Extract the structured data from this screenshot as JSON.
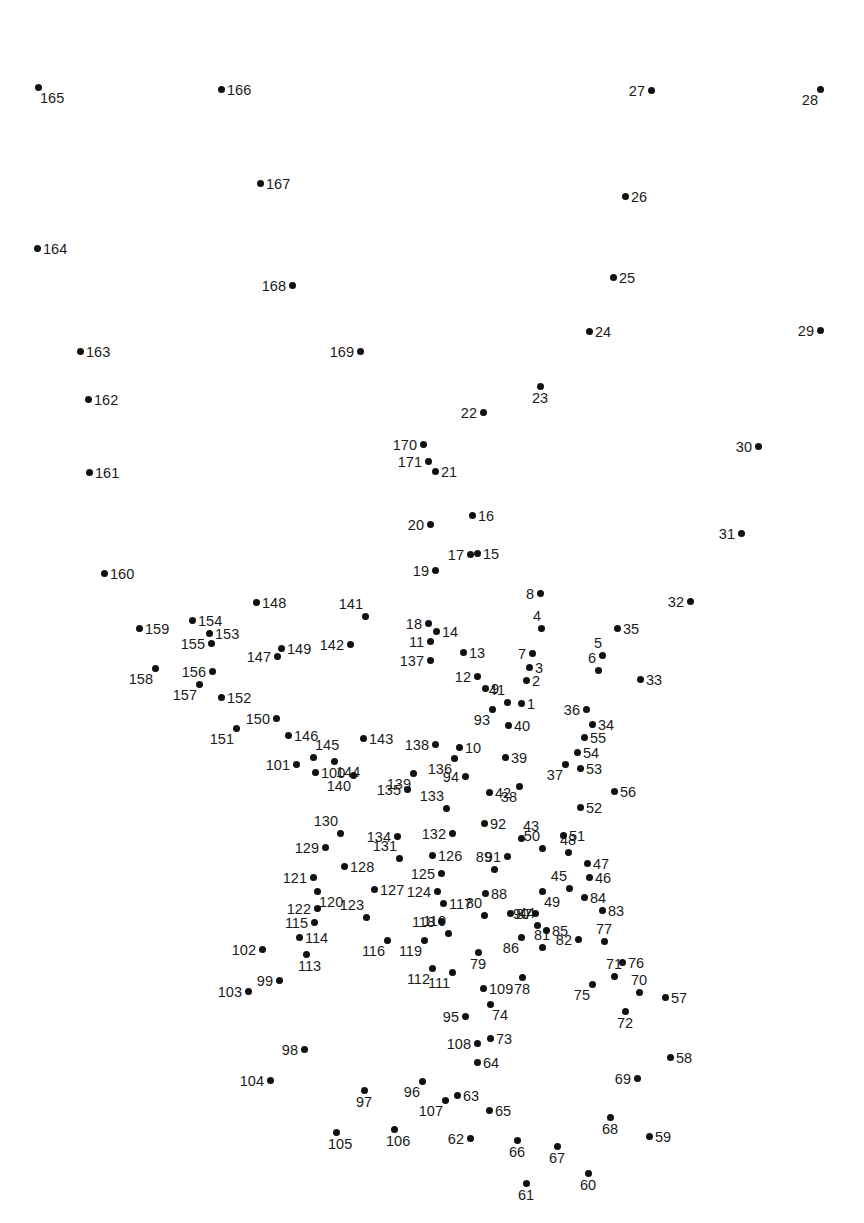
{
  "page": {
    "width": 864,
    "height": 1223,
    "background_color": "#ffffff",
    "dot_color": "#101010",
    "label_color": "#1a1a1a",
    "total_dots": 171
  },
  "chart_data": {
    "type": "scatter",
    "title": "",
    "xlabel": "",
    "ylabel": "",
    "grid": false,
    "legend": null,
    "xlim": [
      0,
      864
    ],
    "ylim": [
      0,
      1223
    ],
    "note": "Numbered connect-the-dots points; coordinates are pixel positions with y increasing downward.",
    "points": [
      {
        "n": 1,
        "x": 521,
        "y": 703,
        "pos": "right"
      },
      {
        "n": 2,
        "x": 526,
        "y": 680,
        "pos": "right"
      },
      {
        "n": 3,
        "x": 529,
        "y": 667,
        "pos": "right"
      },
      {
        "n": 4,
        "x": 541,
        "y": 628,
        "pos": "above"
      },
      {
        "n": 5,
        "x": 602,
        "y": 655,
        "pos": "above"
      },
      {
        "n": 6,
        "x": 598,
        "y": 670,
        "pos": "above-left"
      },
      {
        "n": 7,
        "x": 532,
        "y": 653,
        "pos": "left"
      },
      {
        "n": 8,
        "x": 540,
        "y": 593,
        "pos": "left"
      },
      {
        "n": 9,
        "x": 485,
        "y": 688,
        "pos": "right"
      },
      {
        "n": 10,
        "x": 459,
        "y": 747,
        "pos": "right"
      },
      {
        "n": 11,
        "x": 430,
        "y": 641,
        "pos": "left"
      },
      {
        "n": 12,
        "x": 477,
        "y": 676,
        "pos": "left"
      },
      {
        "n": 13,
        "x": 463,
        "y": 652,
        "pos": "right"
      },
      {
        "n": 14,
        "x": 436,
        "y": 631,
        "pos": "right"
      },
      {
        "n": 15,
        "x": 477,
        "y": 553,
        "pos": "right"
      },
      {
        "n": 16,
        "x": 472,
        "y": 515,
        "pos": "right"
      },
      {
        "n": 17,
        "x": 470,
        "y": 554,
        "pos": "left"
      },
      {
        "n": 18,
        "x": 428,
        "y": 623,
        "pos": "left"
      },
      {
        "n": 19,
        "x": 435,
        "y": 570,
        "pos": "left"
      },
      {
        "n": 20,
        "x": 430,
        "y": 524,
        "pos": "left"
      },
      {
        "n": 21,
        "x": 435,
        "y": 471,
        "pos": "right"
      },
      {
        "n": 22,
        "x": 483,
        "y": 412,
        "pos": "left"
      },
      {
        "n": 23,
        "x": 540,
        "y": 386,
        "pos": "below"
      },
      {
        "n": 24,
        "x": 589,
        "y": 331,
        "pos": "right"
      },
      {
        "n": 25,
        "x": 613,
        "y": 277,
        "pos": "right"
      },
      {
        "n": 26,
        "x": 625,
        "y": 196,
        "pos": "right"
      },
      {
        "n": 27,
        "x": 651,
        "y": 90,
        "pos": "left"
      },
      {
        "n": 28,
        "x": 820,
        "y": 89,
        "pos": "below-left"
      },
      {
        "n": 29,
        "x": 820,
        "y": 330,
        "pos": "left"
      },
      {
        "n": 30,
        "x": 758,
        "y": 446,
        "pos": "left"
      },
      {
        "n": 31,
        "x": 741,
        "y": 533,
        "pos": "left"
      },
      {
        "n": 32,
        "x": 690,
        "y": 601,
        "pos": "left"
      },
      {
        "n": 33,
        "x": 640,
        "y": 679,
        "pos": "right"
      },
      {
        "n": 34,
        "x": 592,
        "y": 724,
        "pos": "right"
      },
      {
        "n": 35,
        "x": 617,
        "y": 628,
        "pos": "right"
      },
      {
        "n": 36,
        "x": 586,
        "y": 709,
        "pos": "left"
      },
      {
        "n": 37,
        "x": 565,
        "y": 764,
        "pos": "below-left"
      },
      {
        "n": 38,
        "x": 519,
        "y": 786,
        "pos": "below-left"
      },
      {
        "n": 39,
        "x": 505,
        "y": 757,
        "pos": "right"
      },
      {
        "n": 40,
        "x": 508,
        "y": 725,
        "pos": "right"
      },
      {
        "n": 41,
        "x": 507,
        "y": 702,
        "pos": "above-left"
      },
      {
        "n": 42,
        "x": 489,
        "y": 792,
        "pos": "right"
      },
      {
        "n": 43,
        "x": 521,
        "y": 838,
        "pos": "above-right"
      },
      {
        "n": 44,
        "x": 537,
        "y": 925,
        "pos": "above-left"
      },
      {
        "n": 45,
        "x": 569,
        "y": 888,
        "pos": "above-left"
      },
      {
        "n": 46,
        "x": 589,
        "y": 877,
        "pos": "right"
      },
      {
        "n": 47,
        "x": 587,
        "y": 863,
        "pos": "right"
      },
      {
        "n": 48,
        "x": 568,
        "y": 852,
        "pos": "above"
      },
      {
        "n": 49,
        "x": 542,
        "y": 891,
        "pos": "below-right"
      },
      {
        "n": 50,
        "x": 542,
        "y": 848,
        "pos": "above-left"
      },
      {
        "n": 51,
        "x": 563,
        "y": 835,
        "pos": "right"
      },
      {
        "n": 52,
        "x": 580,
        "y": 807,
        "pos": "right"
      },
      {
        "n": 53,
        "x": 580,
        "y": 768,
        "pos": "right"
      },
      {
        "n": 54,
        "x": 577,
        "y": 752,
        "pos": "right"
      },
      {
        "n": 55,
        "x": 584,
        "y": 737,
        "pos": "right"
      },
      {
        "n": 56,
        "x": 614,
        "y": 791,
        "pos": "right"
      },
      {
        "n": 57,
        "x": 665,
        "y": 997,
        "pos": "right"
      },
      {
        "n": 58,
        "x": 670,
        "y": 1057,
        "pos": "right"
      },
      {
        "n": 59,
        "x": 649,
        "y": 1136,
        "pos": "right"
      },
      {
        "n": 60,
        "x": 588,
        "y": 1173,
        "pos": "below"
      },
      {
        "n": 61,
        "x": 526,
        "y": 1183,
        "pos": "below"
      },
      {
        "n": 62,
        "x": 470,
        "y": 1138,
        "pos": "left"
      },
      {
        "n": 63,
        "x": 457,
        "y": 1095,
        "pos": "right"
      },
      {
        "n": 64,
        "x": 477,
        "y": 1062,
        "pos": "right"
      },
      {
        "n": 65,
        "x": 489,
        "y": 1110,
        "pos": "right"
      },
      {
        "n": 66,
        "x": 517,
        "y": 1140,
        "pos": "below"
      },
      {
        "n": 67,
        "x": 557,
        "y": 1146,
        "pos": "below"
      },
      {
        "n": 68,
        "x": 610,
        "y": 1117,
        "pos": "below"
      },
      {
        "n": 69,
        "x": 637,
        "y": 1078,
        "pos": "left"
      },
      {
        "n": 70,
        "x": 639,
        "y": 992,
        "pos": "above"
      },
      {
        "n": 71,
        "x": 614,
        "y": 976,
        "pos": "above"
      },
      {
        "n": 72,
        "x": 625,
        "y": 1011,
        "pos": "below"
      },
      {
        "n": 73,
        "x": 490,
        "y": 1038,
        "pos": "right"
      },
      {
        "n": 74,
        "x": 490,
        "y": 1004,
        "pos": "below-right"
      },
      {
        "n": 75,
        "x": 592,
        "y": 984,
        "pos": "below-left"
      },
      {
        "n": 76,
        "x": 622,
        "y": 962,
        "pos": "right"
      },
      {
        "n": 77,
        "x": 604,
        "y": 941,
        "pos": "above"
      },
      {
        "n": 78,
        "x": 522,
        "y": 977,
        "pos": "below"
      },
      {
        "n": 79,
        "x": 478,
        "y": 952,
        "pos": "below"
      },
      {
        "n": 80,
        "x": 484,
        "y": 915,
        "pos": "above-left"
      },
      {
        "n": 81,
        "x": 542,
        "y": 947,
        "pos": "above"
      },
      {
        "n": 82,
        "x": 578,
        "y": 939,
        "pos": "left"
      },
      {
        "n": 83,
        "x": 602,
        "y": 910,
        "pos": "right"
      },
      {
        "n": 84,
        "x": 584,
        "y": 897,
        "pos": "right"
      },
      {
        "n": 85,
        "x": 546,
        "y": 930,
        "pos": "right"
      },
      {
        "n": 86,
        "x": 521,
        "y": 937,
        "pos": "below-left"
      },
      {
        "n": 87,
        "x": 510,
        "y": 913,
        "pos": "right"
      },
      {
        "n": 88,
        "x": 485,
        "y": 893,
        "pos": "right"
      },
      {
        "n": 89,
        "x": 494,
        "y": 869,
        "pos": "above-left"
      },
      {
        "n": 90,
        "x": 535,
        "y": 913,
        "pos": "left"
      },
      {
        "n": 91,
        "x": 507,
        "y": 856,
        "pos": "left"
      },
      {
        "n": 92,
        "x": 484,
        "y": 823,
        "pos": "right"
      },
      {
        "n": 93,
        "x": 492,
        "y": 709,
        "pos": "below-left"
      },
      {
        "n": 94,
        "x": 465,
        "y": 776,
        "pos": "left"
      },
      {
        "n": 95,
        "x": 465,
        "y": 1016,
        "pos": "left"
      },
      {
        "n": 96,
        "x": 422,
        "y": 1081,
        "pos": "below-left"
      },
      {
        "n": 97,
        "x": 364,
        "y": 1090,
        "pos": "below"
      },
      {
        "n": 98,
        "x": 304,
        "y": 1049,
        "pos": "left"
      },
      {
        "n": 99,
        "x": 279,
        "y": 980,
        "pos": "left"
      },
      {
        "n": 100,
        "x": 315,
        "y": 772,
        "pos": "right"
      },
      {
        "n": 101,
        "x": 296,
        "y": 764,
        "pos": "left"
      },
      {
        "n": 102,
        "x": 262,
        "y": 949,
        "pos": "left"
      },
      {
        "n": 103,
        "x": 248,
        "y": 991,
        "pos": "left"
      },
      {
        "n": 104,
        "x": 270,
        "y": 1080,
        "pos": "left"
      },
      {
        "n": 105,
        "x": 336,
        "y": 1132,
        "pos": "below"
      },
      {
        "n": 106,
        "x": 394,
        "y": 1129,
        "pos": "below"
      },
      {
        "n": 107,
        "x": 445,
        "y": 1100,
        "pos": "below-left"
      },
      {
        "n": 108,
        "x": 477,
        "y": 1043,
        "pos": "left"
      },
      {
        "n": 109,
        "x": 483,
        "y": 988,
        "pos": "right"
      },
      {
        "n": 110,
        "x": 448,
        "y": 933,
        "pos": "above-left"
      },
      {
        "n": 111,
        "x": 452,
        "y": 972,
        "pos": "below-left"
      },
      {
        "n": 112,
        "x": 432,
        "y": 968,
        "pos": "below-left"
      },
      {
        "n": 113,
        "x": 306,
        "y": 954,
        "pos": "below"
      },
      {
        "n": 114,
        "x": 299,
        "y": 937,
        "pos": "right"
      },
      {
        "n": 115,
        "x": 314,
        "y": 922,
        "pos": "left"
      },
      {
        "n": 116,
        "x": 387,
        "y": 940,
        "pos": "below-left"
      },
      {
        "n": 117,
        "x": 443,
        "y": 903,
        "pos": "right"
      },
      {
        "n": 118,
        "x": 441,
        "y": 921,
        "pos": "left"
      },
      {
        "n": 119,
        "x": 424,
        "y": 940,
        "pos": "below-left"
      },
      {
        "n": 120,
        "x": 317,
        "y": 891,
        "pos": "below-right"
      },
      {
        "n": 121,
        "x": 313,
        "y": 877,
        "pos": "left"
      },
      {
        "n": 122,
        "x": 317,
        "y": 908,
        "pos": "left"
      },
      {
        "n": 123,
        "x": 366,
        "y": 917,
        "pos": "above-left"
      },
      {
        "n": 124,
        "x": 437,
        "y": 891,
        "pos": "left"
      },
      {
        "n": 125,
        "x": 441,
        "y": 873,
        "pos": "left"
      },
      {
        "n": 126,
        "x": 432,
        "y": 855,
        "pos": "right"
      },
      {
        "n": 127,
        "x": 374,
        "y": 889,
        "pos": "right"
      },
      {
        "n": 128,
        "x": 344,
        "y": 866,
        "pos": "right"
      },
      {
        "n": 129,
        "x": 325,
        "y": 847,
        "pos": "left"
      },
      {
        "n": 130,
        "x": 340,
        "y": 833,
        "pos": "above-left"
      },
      {
        "n": 131,
        "x": 399,
        "y": 858,
        "pos": "above-left"
      },
      {
        "n": 132,
        "x": 452,
        "y": 833,
        "pos": "left"
      },
      {
        "n": 133,
        "x": 446,
        "y": 808,
        "pos": "above-left"
      },
      {
        "n": 134,
        "x": 397,
        "y": 836,
        "pos": "left"
      },
      {
        "n": 135,
        "x": 407,
        "y": 789,
        "pos": "left"
      },
      {
        "n": 136,
        "x": 454,
        "y": 758,
        "pos": "below-left"
      },
      {
        "n": 137,
        "x": 430,
        "y": 660,
        "pos": "left"
      },
      {
        "n": 138,
        "x": 435,
        "y": 744,
        "pos": "left"
      },
      {
        "n": 139,
        "x": 413,
        "y": 773,
        "pos": "below-left"
      },
      {
        "n": 140,
        "x": 353,
        "y": 775,
        "pos": "below-left"
      },
      {
        "n": 141,
        "x": 365,
        "y": 616,
        "pos": "above-left"
      },
      {
        "n": 142,
        "x": 350,
        "y": 644,
        "pos": "left"
      },
      {
        "n": 143,
        "x": 363,
        "y": 738,
        "pos": "right"
      },
      {
        "n": 144,
        "x": 334,
        "y": 761,
        "pos": "below-right"
      },
      {
        "n": 145,
        "x": 313,
        "y": 757,
        "pos": "above-right"
      },
      {
        "n": 146,
        "x": 288,
        "y": 735,
        "pos": "right"
      },
      {
        "n": 147,
        "x": 277,
        "y": 656,
        "pos": "left"
      },
      {
        "n": 148,
        "x": 256,
        "y": 602,
        "pos": "right"
      },
      {
        "n": 149,
        "x": 281,
        "y": 648,
        "pos": "right"
      },
      {
        "n": 150,
        "x": 276,
        "y": 718,
        "pos": "left"
      },
      {
        "n": 151,
        "x": 236,
        "y": 728,
        "pos": "below-left"
      },
      {
        "n": 152,
        "x": 221,
        "y": 697,
        "pos": "right"
      },
      {
        "n": 153,
        "x": 209,
        "y": 633,
        "pos": "right"
      },
      {
        "n": 154,
        "x": 192,
        "y": 620,
        "pos": "right"
      },
      {
        "n": 155,
        "x": 211,
        "y": 643,
        "pos": "left"
      },
      {
        "n": 156,
        "x": 212,
        "y": 671,
        "pos": "left"
      },
      {
        "n": 157,
        "x": 199,
        "y": 684,
        "pos": "below-left"
      },
      {
        "n": 158,
        "x": 155,
        "y": 668,
        "pos": "below-left"
      },
      {
        "n": 159,
        "x": 139,
        "y": 628,
        "pos": "right"
      },
      {
        "n": 160,
        "x": 104,
        "y": 573,
        "pos": "right"
      },
      {
        "n": 161,
        "x": 89,
        "y": 472,
        "pos": "right"
      },
      {
        "n": 162,
        "x": 88,
        "y": 399,
        "pos": "right"
      },
      {
        "n": 163,
        "x": 80,
        "y": 351,
        "pos": "right"
      },
      {
        "n": 164,
        "x": 37,
        "y": 248,
        "pos": "right"
      },
      {
        "n": 165,
        "x": 38,
        "y": 87,
        "pos": "below-right"
      },
      {
        "n": 166,
        "x": 221,
        "y": 89,
        "pos": "right"
      },
      {
        "n": 167,
        "x": 260,
        "y": 183,
        "pos": "right"
      },
      {
        "n": 168,
        "x": 292,
        "y": 285,
        "pos": "left"
      },
      {
        "n": 169,
        "x": 360,
        "y": 351,
        "pos": "left"
      },
      {
        "n": 170,
        "x": 423,
        "y": 444,
        "pos": "left"
      },
      {
        "n": 171,
        "x": 428,
        "y": 461,
        "pos": "left"
      }
    ]
  }
}
